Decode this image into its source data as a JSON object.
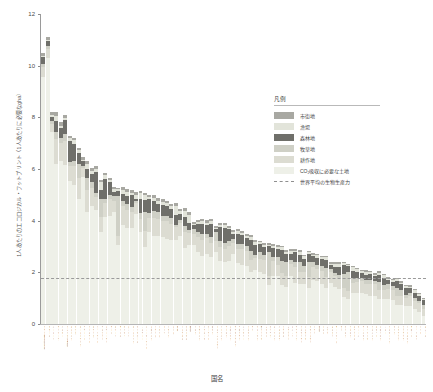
{
  "chart_data": {
    "type": "bar",
    "stacked": true,
    "title": "",
    "xlabel": "国名",
    "ylabel": "1人あたりのエコロジカル・フットプリント（1人あたりに必要なgha）",
    "ylim": [
      0,
      12
    ],
    "yticks": [
      0,
      2,
      4,
      6,
      8,
      10,
      12
    ],
    "grid": false,
    "legend_position": "right-upper",
    "reference_line": {
      "label": "世界平均の生物生産力",
      "value": 1.8,
      "style": "dashed"
    },
    "series": [
      {
        "name": "市街地",
        "color": "#a8a8a2"
      },
      {
        "name": "漁場",
        "color": "#e2e4da"
      },
      {
        "name": "森林地",
        "color": "#6f6f6a"
      },
      {
        "name": "牧草地",
        "color": "#cfd0c6"
      },
      {
        "name": "耕作地",
        "color": "#dcdcd2"
      },
      {
        "name": "CO₂吸収に必要な土地",
        "color": "#eef0e8"
      }
    ],
    "categories": [
      "アラブ首長国連邦",
      "カタール",
      "バーレーン",
      "デンマーク",
      "ベルギー",
      "アメリカ合衆国",
      "エストニア",
      "カナダ",
      "オーストラリア",
      "クウェート",
      "アイルランド",
      "オランダ",
      "フィンランド",
      "ウルグアイ",
      "スウェーデン",
      "チェコ",
      "オマーン",
      "モンゴル",
      "ギリシャ",
      "スペイン",
      "オーストリア",
      "シンガポール",
      "ノルウェー",
      "ニュージーランド",
      "スロベニア",
      "フランス",
      "イギリス",
      "ドイツ",
      "イタリア",
      "スイス",
      "日本",
      "イスラエル",
      "ポルトガル",
      "韓国",
      "リビア",
      "マケドニア",
      "ベラルーシ",
      "ポーランド",
      "ロシア",
      "トルクメニスタン",
      "リトアニア",
      "ラトビア",
      "スロバキア",
      "サウジアラビア",
      "クロアチア",
      "ハンガリー",
      "ブルガリア",
      "チリ",
      "マレーシア",
      "南アフリカ",
      "メキシコ",
      "ボツワナ",
      "ルーマニア",
      "ベネズエラ",
      "ブラジル",
      "パラグアイ",
      "レバノン",
      "ウクライナ",
      "アルゼンチン",
      "コスタリカ",
      "カザフスタン",
      "イラン",
      "中国",
      "トルコ",
      "パナマ",
      "ヨルダン",
      "モーリシャス",
      "タイ",
      "ボリビア",
      "ナミビア",
      "エクアドル",
      "キューバ",
      "チュニジア",
      "ジャマイカ",
      "アルバニア",
      "エジプト",
      "コロンビア",
      "ペルー",
      "アルジェリア",
      "シリア",
      "ニカラグア",
      "グアテマラ",
      "インドネシア",
      "モロッコ",
      "フィリピン",
      "インド",
      "ネパール"
    ],
    "values": [
      [
        0.13,
        0.06,
        0.25,
        0.14,
        0.38,
        9.55
      ],
      [
        0.12,
        0.05,
        0.2,
        0.12,
        0.33,
        10.3
      ],
      [
        0.1,
        0.08,
        0.18,
        0.1,
        0.3,
        7.45
      ],
      [
        0.12,
        0.22,
        0.4,
        0.3,
        0.95,
        6.2
      ],
      [
        0.14,
        0.1,
        0.35,
        0.22,
        0.7,
        6.3
      ],
      [
        0.11,
        0.07,
        0.55,
        0.25,
        0.95,
        6.15
      ],
      [
        0.09,
        0.12,
        0.8,
        0.18,
        0.55,
        5.55
      ],
      [
        0.1,
        0.14,
        0.65,
        0.22,
        0.7,
        5.4
      ],
      [
        0.09,
        0.1,
        0.42,
        0.55,
        0.8,
        4.85
      ],
      [
        0.1,
        0.05,
        0.18,
        0.1,
        0.32,
        5.7
      ],
      [
        0.12,
        0.18,
        0.35,
        0.45,
        0.85,
        4.35
      ],
      [
        0.13,
        0.12,
        0.32,
        0.24,
        0.7,
        4.55
      ],
      [
        0.08,
        0.14,
        0.82,
        0.16,
        0.5,
        4.4
      ],
      [
        0.08,
        0.3,
        0.35,
        0.7,
        0.6,
        3.55
      ],
      [
        0.08,
        0.15,
        0.78,
        0.18,
        0.52,
        4.15
      ],
      [
        0.1,
        0.06,
        0.5,
        0.16,
        0.65,
        4.2
      ],
      [
        0.07,
        0.12,
        0.15,
        0.2,
        0.4,
        4.35
      ],
      [
        0.05,
        0.08,
        0.2,
        1.55,
        0.35,
        3.05
      ],
      [
        0.1,
        0.14,
        0.3,
        0.2,
        0.7,
        3.85
      ],
      [
        0.11,
        0.16,
        0.32,
        0.22,
        0.72,
        3.7
      ],
      [
        0.11,
        0.08,
        0.45,
        0.22,
        0.62,
        3.7
      ],
      [
        0.12,
        0.14,
        0.1,
        0.08,
        0.42,
        4.25
      ],
      [
        0.09,
        0.22,
        0.55,
        0.22,
        0.52,
        3.55
      ],
      [
        0.08,
        0.2,
        0.45,
        0.75,
        0.6,
        3.0
      ],
      [
        0.09,
        0.08,
        0.55,
        0.18,
        0.55,
        3.55
      ],
      [
        0.11,
        0.12,
        0.4,
        0.25,
        0.72,
        3.4
      ],
      [
        0.12,
        0.12,
        0.32,
        0.24,
        0.68,
        3.4
      ],
      [
        0.12,
        0.1,
        0.42,
        0.2,
        0.65,
        3.35
      ],
      [
        0.11,
        0.12,
        0.35,
        0.2,
        0.7,
        3.3
      ],
      [
        0.1,
        0.08,
        0.38,
        0.22,
        0.62,
        3.25
      ],
      [
        0.1,
        0.35,
        0.38,
        0.1,
        0.5,
        3.25
      ],
      [
        0.1,
        0.1,
        0.22,
        0.12,
        0.52,
        3.4
      ],
      [
        0.1,
        0.25,
        0.35,
        0.22,
        0.62,
        2.95
      ],
      [
        0.11,
        0.3,
        0.3,
        0.1,
        0.48,
        3.05
      ],
      [
        0.07,
        0.06,
        0.15,
        0.18,
        0.45,
        3.05
      ],
      [
        0.08,
        0.08,
        0.3,
        0.22,
        0.55,
        2.8
      ],
      [
        0.08,
        0.08,
        0.42,
        0.2,
        0.62,
        2.65
      ],
      [
        0.09,
        0.08,
        0.35,
        0.18,
        0.62,
        2.7
      ],
      [
        0.08,
        0.1,
        0.52,
        0.2,
        0.55,
        2.6
      ],
      [
        0.06,
        0.05,
        0.12,
        0.35,
        0.4,
        2.8
      ],
      [
        0.08,
        0.1,
        0.55,
        0.2,
        0.55,
        2.45
      ],
      [
        0.08,
        0.12,
        0.58,
        0.2,
        0.52,
        2.4
      ],
      [
        0.08,
        0.06,
        0.45,
        0.18,
        0.58,
        2.45
      ],
      [
        0.08,
        0.08,
        0.18,
        0.14,
        0.45,
        2.7
      ],
      [
        0.08,
        0.1,
        0.42,
        0.18,
        0.55,
        2.35
      ],
      [
        0.09,
        0.06,
        0.35,
        0.18,
        0.62,
        2.3
      ],
      [
        0.08,
        0.06,
        0.32,
        0.18,
        0.58,
        2.25
      ],
      [
        0.07,
        0.12,
        0.42,
        0.35,
        0.48,
        2.0
      ],
      [
        0.07,
        0.14,
        0.38,
        0.12,
        0.45,
        2.1
      ],
      [
        0.07,
        0.08,
        0.28,
        0.3,
        0.5,
        2.0
      ],
      [
        0.07,
        0.1,
        0.3,
        0.2,
        0.52,
        1.95
      ],
      [
        0.05,
        0.05,
        0.22,
        0.95,
        0.35,
        1.5
      ],
      [
        0.08,
        0.06,
        0.35,
        0.18,
        0.58,
        1.85
      ],
      [
        0.07,
        0.1,
        0.32,
        0.28,
        0.45,
        1.85
      ],
      [
        0.07,
        0.12,
        0.42,
        0.45,
        0.48,
        1.5
      ],
      [
        0.05,
        0.08,
        0.3,
        0.55,
        0.42,
        1.45
      ],
      [
        0.08,
        0.1,
        0.25,
        0.14,
        0.48,
        1.85
      ],
      [
        0.08,
        0.06,
        0.38,
        0.2,
        0.6,
        1.6
      ],
      [
        0.07,
        0.1,
        0.28,
        0.4,
        0.45,
        1.55
      ],
      [
        0.07,
        0.12,
        0.25,
        0.25,
        0.45,
        1.55
      ],
      [
        0.06,
        0.06,
        0.3,
        0.6,
        0.42,
        1.4
      ],
      [
        0.07,
        0.06,
        0.22,
        0.18,
        0.52,
        1.7
      ],
      [
        0.07,
        0.1,
        0.28,
        0.15,
        0.48,
        1.65
      ],
      [
        0.07,
        0.08,
        0.25,
        0.18,
        0.52,
        1.55
      ],
      [
        0.06,
        0.12,
        0.3,
        0.35,
        0.42,
        1.4
      ],
      [
        0.06,
        0.05,
        0.15,
        0.12,
        0.42,
        1.6
      ],
      [
        0.06,
        0.14,
        0.22,
        0.12,
        0.4,
        1.45
      ],
      [
        0.06,
        0.15,
        0.28,
        0.14,
        0.42,
        1.35
      ],
      [
        0.05,
        0.08,
        0.32,
        0.55,
        0.35,
        1.05
      ],
      [
        0.04,
        0.06,
        0.22,
        0.75,
        0.32,
        0.95
      ],
      [
        0.06,
        0.14,
        0.28,
        0.18,
        0.4,
        1.2
      ],
      [
        0.06,
        0.12,
        0.22,
        0.16,
        0.42,
        1.2
      ],
      [
        0.06,
        0.06,
        0.2,
        0.14,
        0.45,
        1.2
      ],
      [
        0.06,
        0.12,
        0.22,
        0.14,
        0.4,
        1.15
      ],
      [
        0.06,
        0.06,
        0.24,
        0.16,
        0.45,
        1.1
      ],
      [
        0.06,
        0.06,
        0.18,
        0.12,
        0.45,
        1.1
      ],
      [
        0.05,
        0.08,
        0.28,
        0.3,
        0.38,
        0.95
      ],
      [
        0.05,
        0.1,
        0.25,
        0.2,
        0.38,
        0.95
      ],
      [
        0.05,
        0.05,
        0.16,
        0.18,
        0.42,
        0.95
      ],
      [
        0.05,
        0.06,
        0.18,
        0.14,
        0.4,
        0.92
      ],
      [
        0.05,
        0.08,
        0.26,
        0.3,
        0.35,
        0.75
      ],
      [
        0.05,
        0.06,
        0.24,
        0.22,
        0.36,
        0.72
      ],
      [
        0.05,
        0.1,
        0.26,
        0.1,
        0.34,
        0.68
      ],
      [
        0.05,
        0.05,
        0.18,
        0.14,
        0.38,
        0.7
      ],
      [
        0.05,
        0.1,
        0.22,
        0.1,
        0.32,
        0.58
      ],
      [
        0.05,
        0.05,
        0.2,
        0.1,
        0.34,
        0.46
      ],
      [
        0.04,
        0.04,
        0.22,
        0.12,
        0.3,
        0.3
      ]
    ]
  },
  "legend": {
    "title": "凡例",
    "items": [
      {
        "label": "市街地"
      },
      {
        "label": "漁場"
      },
      {
        "label": "森林地"
      },
      {
        "label": "牧草地"
      },
      {
        "label": "耕作地"
      },
      {
        "label": "CO₂吸収に必要な土地"
      },
      {
        "label": "世界平均の生物生産力"
      }
    ]
  }
}
